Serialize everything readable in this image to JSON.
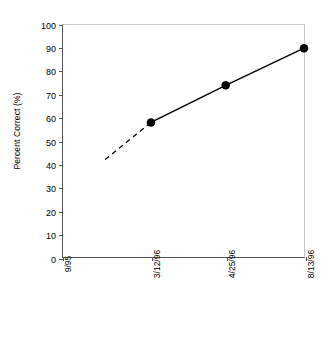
{
  "chart_data": {
    "type": "line",
    "title": "",
    "xlabel": "",
    "ylabel": "Percent Correct (%)",
    "categories": [
      "9/95",
      "3/12/96",
      "4/25/96",
      "8/13/96"
    ],
    "values": [
      null,
      58,
      74,
      90
    ],
    "ylim": [
      0,
      100
    ],
    "y_ticks": [
      0,
      10,
      20,
      30,
      40,
      50,
      60,
      70,
      80,
      90,
      100
    ],
    "grid": false,
    "legend": "none",
    "series": [
      {
        "name": "Percent Correct",
        "style": "solid",
        "marker": "filled-circle",
        "points": [
          {
            "x": "3/12/96",
            "y": 58
          },
          {
            "x": "4/25/96",
            "y": 74
          },
          {
            "x": "8/13/96",
            "y": 90
          }
        ]
      },
      {
        "name": "Extrapolated baseline",
        "style": "dashed",
        "marker": "none",
        "points": [
          {
            "x": "1/96",
            "y": 42
          },
          {
            "x": "3/12/96",
            "y": 58
          }
        ]
      }
    ],
    "annotations": []
  },
  "axes": {
    "y_tick_labels": [
      "0",
      "10",
      "20",
      "30",
      "40",
      "50",
      "60",
      "70",
      "80",
      "90",
      "100"
    ],
    "x_tick_labels": [
      "9/95",
      "3/12/96",
      "4/25/96",
      "8/13/96"
    ],
    "y_title": "Percent Correct (%)"
  },
  "colors": {
    "line": "#000000",
    "marker": "#000000",
    "axis": "#555555",
    "frame": "#c8c8c8",
    "background": "#ffffff",
    "text": "#000000"
  }
}
